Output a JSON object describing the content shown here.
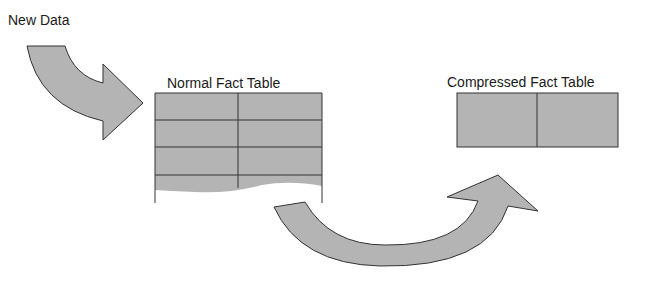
{
  "labels": {
    "new_data": "New Data",
    "normal_table": "Normal Fact Table",
    "compressed_table": "Compressed Fact Table"
  },
  "colors": {
    "fill": "#b4b4b4",
    "stroke": "#333333",
    "text": "#1a1a1a",
    "background": "#ffffff"
  },
  "normal_table": {
    "columns": 2,
    "visible_rows": 4,
    "truncated": true
  },
  "compressed_table": {
    "columns": 2,
    "rows": 1
  }
}
